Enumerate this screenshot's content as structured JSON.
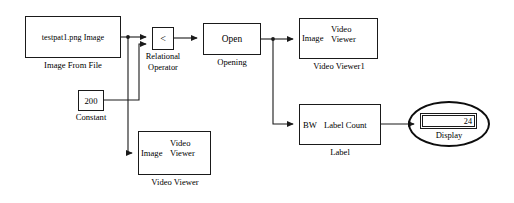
{
  "diagram": {
    "background_color": "#ffffff",
    "line_color": "#1a1a1a"
  },
  "blocks": {
    "image_from_file": {
      "body_text": "testpat1.png Image",
      "caption": "Image From File"
    },
    "relational_operator": {
      "body_text": "<",
      "caption_line1": "Relational",
      "caption_line2": "Operator"
    },
    "opening": {
      "body_text": "Open",
      "caption": "Opening"
    },
    "video_viewer1": {
      "input_port": "Image",
      "title_line1": "Video",
      "title_line2": "Viewer",
      "caption": "Video Viewer1"
    },
    "constant": {
      "body_text": "200",
      "caption": "Constant"
    },
    "video_viewer": {
      "input_port": "Image",
      "title_line1": "Video",
      "title_line2": "Viewer",
      "caption": "Video Viewer"
    },
    "label": {
      "input_port": "BW",
      "output_port": "Label Count",
      "caption": "Label"
    },
    "display": {
      "value": "24",
      "caption": "Display"
    }
  },
  "annotations": {
    "highlight_ellipse": {
      "name": "display-highlight-ellipse",
      "color": "#0d0d0d"
    }
  }
}
